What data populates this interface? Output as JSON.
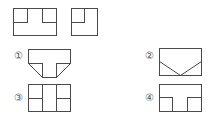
{
  "given_views": [
    {
      "name": "front-view"
    },
    {
      "name": "side-view"
    }
  ],
  "options": [
    {
      "label": "①"
    },
    {
      "label": "②"
    },
    {
      "label": "③"
    },
    {
      "label": "④"
    }
  ],
  "colors": {
    "line": "#4a4a4a",
    "label": "#555555",
    "background": "#ffffff"
  }
}
